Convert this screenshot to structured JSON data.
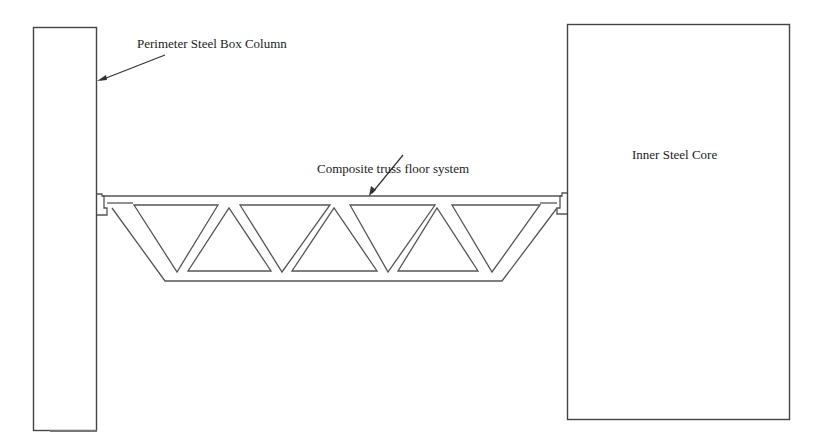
{
  "figure": {
    "type": "structural-section-diagram",
    "labels": {
      "perimeter_column": "Perimeter Steel Box Column",
      "truss_floor": "Composite truss floor system",
      "inner_core": "Inner Steel Core"
    },
    "components": [
      {
        "id": "perimeter-column",
        "label": "Perimeter Steel Box Column",
        "position": "left"
      },
      {
        "id": "truss-floor",
        "label": "Composite truss floor system",
        "position": "center",
        "inverted_triangles": 4,
        "upright_triangles": 3
      },
      {
        "id": "inner-core",
        "label": "Inner Steel Core",
        "position": "right"
      }
    ],
    "colors": {
      "line": "#555555",
      "text": "#222222",
      "background": "#ffffff"
    }
  }
}
